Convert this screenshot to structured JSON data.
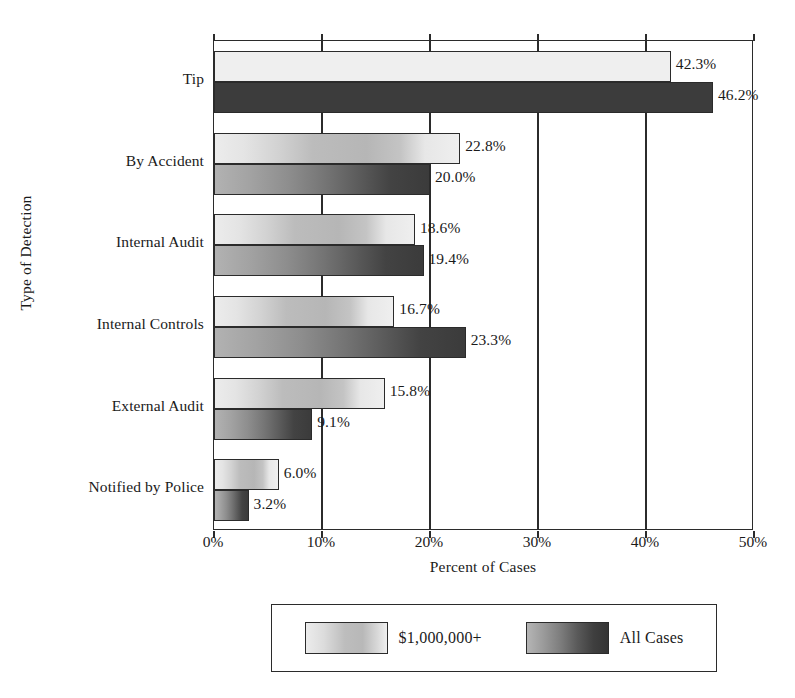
{
  "chart_data": {
    "type": "bar",
    "orientation": "horizontal",
    "title": "",
    "xlabel": "Percent of Cases",
    "ylabel": "Type of Detection",
    "xlim": [
      0,
      50
    ],
    "xticks": [
      "0%",
      "10%",
      "20%",
      "30%",
      "40%",
      "50%"
    ],
    "xtick_values": [
      0,
      10,
      20,
      30,
      40,
      50
    ],
    "grid": "vertical",
    "legend_position": "below-plot",
    "categories": [
      "Tip",
      "By Accident",
      "Internal Audit",
      "Internal Controls",
      "External Audit",
      "Notified by Police"
    ],
    "series": [
      {
        "name": "$1,000,000+",
        "color": "#d9d9d9",
        "values": [
          42.3,
          22.8,
          18.6,
          16.7,
          15.8,
          6.0
        ],
        "labels": [
          "42.3%",
          "22.8%",
          "18.6%",
          "16.7%",
          "15.8%",
          "6.0%"
        ]
      },
      {
        "name": "All Cases",
        "color": "#4a4a4a",
        "values": [
          46.2,
          20.0,
          19.4,
          23.3,
          9.1,
          3.2
        ],
        "labels": [
          "46.2%",
          "20.0%",
          "19.4%",
          "23.3%",
          "9.1%",
          "3.2%"
        ]
      }
    ]
  },
  "legend": {
    "entries": [
      {
        "label": "$1,000,000+",
        "swatch": "light"
      },
      {
        "label": "All Cases",
        "swatch": "dark"
      }
    ]
  }
}
